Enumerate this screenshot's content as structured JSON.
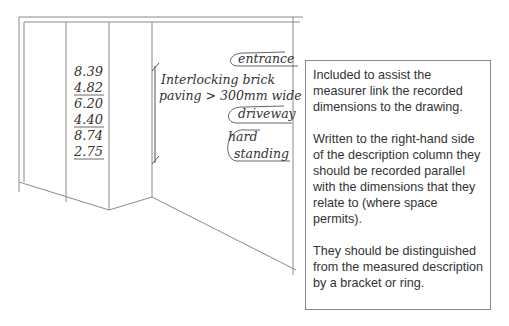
{
  "drawing": {
    "dimensions": [
      {
        "value": "8.39",
        "underlined": false
      },
      {
        "value": "4.82",
        "underlined": true
      },
      {
        "value": "6.20",
        "underlined": false
      },
      {
        "value": "4.40",
        "underlined": true
      },
      {
        "value": "8.74",
        "underlined": false
      },
      {
        "value": "2.75",
        "underlined": true
      }
    ],
    "description_line1": "Interlocking brick",
    "description_line2": "paving > 300mm wide",
    "waste_notes": {
      "entrance": "entrance",
      "driveway": "driveway",
      "hard": "hard",
      "standing": "standing"
    }
  },
  "note": {
    "paragraphs": [
      "Included to assist the measurer link the recorded dimensions to the drawing.",
      "Written to the right-hand side of the description column they should be recorded parallel with the dimensions that they relate to (where space permits).",
      "They should be distinguished from the measured description by a bracket or ring."
    ]
  }
}
